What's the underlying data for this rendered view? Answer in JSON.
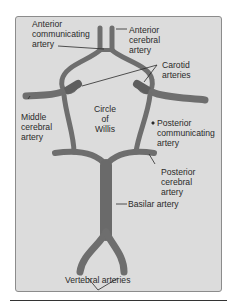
{
  "diagram": {
    "title": "Circle of Willis",
    "colors": {
      "background": "#dcdcdc",
      "vessel": "#6e6e6e",
      "vessel_dark": "#4a4a4a",
      "text": "#2a2a2a",
      "border": "#8c8c8c"
    },
    "labels": {
      "anterior_communicating": "Anterior\ncommunicating\nartery",
      "anterior_cerebral": "Anterior\ncerebral\nartery",
      "carotid": "Carotid\narteries",
      "middle_cerebral": "Middle\ncerebral\nartery",
      "circle_of_willis": "Circle\nof\nWillis",
      "posterior_communicating": "Posterior\ncommunicating\nartery",
      "posterior_cerebral": "Posterior\ncerebral\nartery",
      "basilar": "Basilar artery",
      "vertebral": "Vertebral arteries"
    }
  }
}
